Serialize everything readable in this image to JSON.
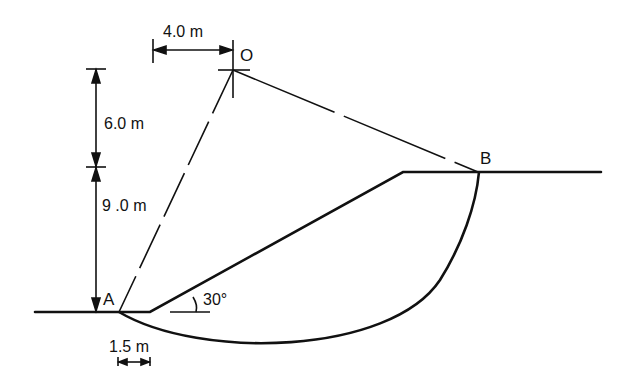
{
  "diagram": {
    "type": "slope-stability-circular-slip",
    "points": {
      "O": {
        "label": "O"
      },
      "A": {
        "label": "A"
      },
      "B": {
        "label": "B"
      }
    },
    "dimensions": {
      "horizontal_offset": "4.0 m",
      "vertical_upper": "6.0 m",
      "vertical_lower": "9 .0 m",
      "toe_offset": "1.5 m"
    },
    "angle": {
      "slope_angle": "30°"
    },
    "colors": {
      "line": "#111111",
      "background": "#ffffff"
    }
  }
}
